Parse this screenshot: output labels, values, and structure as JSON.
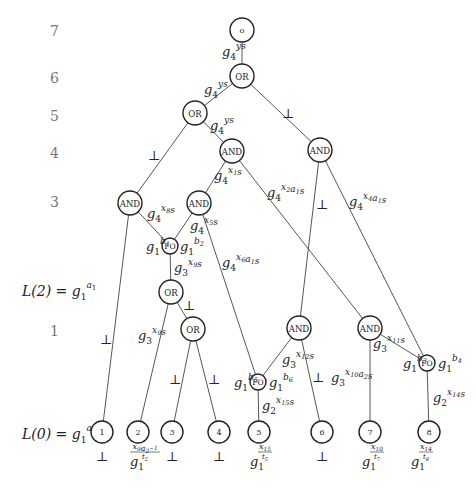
{
  "diagram": {
    "levels": [
      {
        "label": "7",
        "y": 31
      },
      {
        "label": "6",
        "y": 78
      },
      {
        "label": "5",
        "y": 116
      },
      {
        "label": "4",
        "y": 153
      },
      {
        "label": "3",
        "y": 202
      },
      {
        "label": "L(2) = g",
        "sub": "1",
        "sup": "a1",
        "y": 291,
        "equation": true
      },
      {
        "label": "1",
        "y": 331
      },
      {
        "label": "L(0) = g",
        "sub": "1",
        "sup": "a2",
        "y": 434,
        "equation": true
      }
    ],
    "nodes": [
      {
        "id": "root",
        "label": "o",
        "x": 242,
        "y": 30,
        "r": 12
      },
      {
        "id": "or6",
        "label": "OR",
        "x": 242,
        "y": 76,
        "r": 12
      },
      {
        "id": "or5",
        "label": "OR",
        "x": 195,
        "y": 113,
        "r": 12
      },
      {
        "id": "and4m",
        "label": "AND",
        "x": 232,
        "y": 151,
        "r": 12
      },
      {
        "id": "and4r",
        "label": "AND",
        "x": 320,
        "y": 150,
        "r": 12
      },
      {
        "id": "and3l",
        "label": "AND",
        "x": 130,
        "y": 203,
        "r": 12
      },
      {
        "id": "and3m",
        "label": "AND",
        "x": 199,
        "y": 203,
        "r": 12
      },
      {
        "id": "fo1",
        "label": "FO",
        "x": 170,
        "y": 246,
        "r": 8
      },
      {
        "id": "or2a",
        "label": "OR",
        "x": 171,
        "y": 292,
        "r": 12
      },
      {
        "id": "or2b",
        "label": "OR",
        "x": 193,
        "y": 329,
        "r": 12
      },
      {
        "id": "and1a",
        "label": "AND",
        "x": 299,
        "y": 328,
        "r": 12
      },
      {
        "id": "and1b",
        "label": "AND",
        "x": 370,
        "y": 328,
        "r": 12
      },
      {
        "id": "fo2",
        "label": "FO",
        "x": 258,
        "y": 382,
        "r": 8
      },
      {
        "id": "fo3",
        "label": "FO",
        "x": 427,
        "y": 363,
        "r": 8
      },
      {
        "id": "l1",
        "label": "1",
        "x": 102,
        "y": 432,
        "r": 11
      },
      {
        "id": "l2",
        "label": "2",
        "x": 138,
        "y": 432,
        "r": 11
      },
      {
        "id": "l3",
        "label": "3",
        "x": 172,
        "y": 432,
        "r": 11
      },
      {
        "id": "l4",
        "label": "4",
        "x": 219,
        "y": 432,
        "r": 11
      },
      {
        "id": "l5",
        "label": "5",
        "x": 259,
        "y": 432,
        "r": 11
      },
      {
        "id": "l6",
        "label": "6",
        "x": 322,
        "y": 432,
        "r": 11
      },
      {
        "id": "l7",
        "label": "7",
        "x": 370,
        "y": 432,
        "r": 11
      },
      {
        "id": "l8",
        "label": "8",
        "x": 429,
        "y": 432,
        "r": 11
      }
    ],
    "edges": [
      {
        "from": "root",
        "to": "or6",
        "label": {
          "base": "g",
          "sub": "4",
          "sup": "ys",
          "x": 222,
          "y": 56
        }
      },
      {
        "from": "or6",
        "to": "or5",
        "label": {
          "base": "g",
          "sub": "4",
          "sup": "ys",
          "x": 204,
          "y": 94
        }
      },
      {
        "from": "or6",
        "to": "and4r",
        "label": {
          "bot": true,
          "x": 288,
          "y": 118
        }
      },
      {
        "from": "or5",
        "to": "and3l",
        "label": {
          "bot": true,
          "x": 154,
          "y": 160
        }
      },
      {
        "from": "or5",
        "to": "and4m",
        "label": {
          "base": "g",
          "sub": "4",
          "sup": "ys",
          "x": 210,
          "y": 130
        }
      },
      {
        "from": "and4m",
        "to": "and3m",
        "label": {
          "base": "g",
          "sub": "4",
          "sup": "x1s",
          "x": 214,
          "y": 180
        }
      },
      {
        "from": "and4m",
        "to": "and1b",
        "label": {
          "base": "g",
          "sub": "4",
          "sup": "x2a1s",
          "x": 267,
          "y": 197
        }
      },
      {
        "from": "and4r",
        "to": "and1a",
        "label": {
          "bot": true,
          "x": 322,
          "y": 209
        }
      },
      {
        "from": "and4r",
        "to": "fo3",
        "label": {
          "base": "g",
          "sub": "4",
          "sup": "x4a1s",
          "x": 349,
          "y": 206
        }
      },
      {
        "from": "and3l",
        "to": "fo1",
        "label": {
          "base": "g",
          "sub": "4",
          "sup": "x8s",
          "x": 147,
          "y": 218
        }
      },
      {
        "from": "and3l",
        "to": "l1",
        "label": {
          "bot": true,
          "x": 106,
          "y": 344
        }
      },
      {
        "from": "and3m",
        "to": "fo1",
        "label": {
          "base": "g",
          "sub": "4",
          "sup": "x5s",
          "x": 190,
          "y": 230
        }
      },
      {
        "from": "and3m",
        "to": "fo2",
        "label": {
          "base": "g",
          "sub": "4",
          "sup": "x6a1s",
          "x": 222,
          "y": 267
        }
      },
      {
        "from": "fo1",
        "to": "or2a",
        "label": {
          "base": "g",
          "sub": "3",
          "sup": "x9s",
          "x": 174,
          "y": 272
        }
      },
      {
        "from": "or2a",
        "to": "l2",
        "label": {
          "base": "g",
          "sub": "3",
          "sup": "x9s",
          "x": 138,
          "y": 340
        }
      },
      {
        "from": "or2a",
        "to": "or2b",
        "label": {
          "bot": true,
          "x": 189,
          "y": 310
        }
      },
      {
        "from": "or2b",
        "to": "l3",
        "label": {
          "bot": true,
          "x": 175,
          "y": 384
        }
      },
      {
        "from": "or2b",
        "to": "l4",
        "label": {
          "bot": true,
          "x": 214,
          "y": 384
        }
      },
      {
        "from": "and1a",
        "to": "fo2",
        "label": {
          "base": "g",
          "sub": "3",
          "sup": "x12s",
          "x": 282,
          "y": 364
        }
      },
      {
        "from": "and1a",
        "to": "l6",
        "label": {
          "bot": true,
          "x": 318,
          "y": 382
        }
      },
      {
        "from": "and1b",
        "to": "l7",
        "label": {
          "base": "g",
          "sub": "3",
          "sup": "x10a2s",
          "x": 331,
          "y": 382
        }
      },
      {
        "from": "and1b",
        "to": "fo3",
        "label": {
          "base": "g",
          "sub": "3",
          "sup": "x11s",
          "x": 373,
          "y": 348
        }
      },
      {
        "from": "fo2",
        "to": "l5",
        "label": {
          "base": "g",
          "sub": "2",
          "sup": "x15s",
          "x": 262,
          "y": 410
        }
      },
      {
        "from": "fo3",
        "to": "l8",
        "label": {
          "base": "g",
          "sub": "2",
          "sup": "x14s",
          "x": 433,
          "y": 402
        }
      }
    ],
    "fo_labels": [
      {
        "base": "g",
        "sub": "1",
        "sup": "b1",
        "x": 146,
        "y": 251
      },
      {
        "base": "g",
        "sub": "1",
        "sup": "b2",
        "x": 180,
        "y": 251
      },
      {
        "base": "g",
        "sub": "1",
        "sup": "b5",
        "x": 234,
        "y": 387
      },
      {
        "base": "g",
        "sub": "1",
        "sup": "b6",
        "x": 269,
        "y": 387
      },
      {
        "base": "g",
        "sub": "1",
        "sup": "b3",
        "x": 403,
        "y": 368
      },
      {
        "base": "g",
        "sub": "1",
        "sup": "b4",
        "x": 438,
        "y": 368
      }
    ],
    "leaf_labels": [
      {
        "leaf": "1",
        "bot": true,
        "x": 102,
        "y": 461
      },
      {
        "leaf": "2",
        "base": "g",
        "sub": "1",
        "sup": "x9a2^-1 / t2",
        "x": 130,
        "y": 466
      },
      {
        "leaf": "3",
        "bot": true,
        "x": 172,
        "y": 461
      },
      {
        "leaf": "4",
        "bot": true,
        "x": 219,
        "y": 461
      },
      {
        "leaf": "5",
        "base": "g",
        "sub": "1",
        "sup": "x15 / t5",
        "x": 250,
        "y": 466
      },
      {
        "leaf": "6",
        "bot": true,
        "x": 322,
        "y": 461
      },
      {
        "leaf": "7",
        "base": "g",
        "sub": "1",
        "sup": "x10 / t7",
        "x": 362,
        "y": 466
      },
      {
        "leaf": "8",
        "base": "g",
        "sub": "1",
        "sup": "x14 / t8",
        "x": 411,
        "y": 466
      }
    ],
    "bot_symbol": "⊥"
  }
}
